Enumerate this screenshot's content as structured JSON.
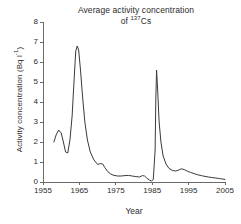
{
  "chart_data": {
    "type": "line",
    "title_line1": "Average activity concentration",
    "title_line2_prefix": "of ",
    "title_isotope_mass": "137",
    "title_isotope_symbol": "Cs",
    "xlabel": "Year",
    "ylabel_prefix": "Activity concentration (Bq l",
    "ylabel_exponent": "-1",
    "ylabel_suffix": ")",
    "xlim": [
      1955,
      2005
    ],
    "ylim": [
      0,
      8
    ],
    "xticks": [
      1955,
      1965,
      1975,
      1985,
      1995,
      2005
    ],
    "yticks": [
      0,
      1,
      2,
      3,
      4,
      5,
      6,
      7,
      8
    ],
    "grid": false,
    "legend": "none",
    "line_color": "#3a3a3a",
    "axis_color": "#6b6b6b",
    "series": [
      {
        "name": "137Cs activity concentration",
        "x": [
          1958.0,
          1958.6,
          1959.3,
          1960.0,
          1960.6,
          1961.2,
          1961.8,
          1962.4,
          1963.0,
          1963.6,
          1964.0,
          1964.4,
          1964.8,
          1965.3,
          1965.9,
          1966.5,
          1967.2,
          1968.0,
          1969.0,
          1970.0,
          1970.8,
          1971.4,
          1972.0,
          1972.8,
          1973.6,
          1974.5,
          1975.5,
          1976.5,
          1977.5,
          1978.5,
          1979.5,
          1980.5,
          1981.5,
          1982.3,
          1982.9,
          1983.5,
          1984.2,
          1984.8,
          1985.3,
          1985.8,
          1986.0,
          1986.2,
          1986.5,
          1986.9,
          1987.4,
          1988.0,
          1988.8,
          1989.6,
          1990.5,
          1991.5,
          1992.3,
          1993.0,
          1993.8,
          1994.6,
          1995.5,
          1996.5,
          1997.5,
          1998.5,
          1999.5,
          2000.5,
          2001.5,
          2002.5,
          2003.5,
          2004.3,
          2005.0
        ],
        "y": [
          2.0,
          2.35,
          2.6,
          2.45,
          2.0,
          1.5,
          1.45,
          2.1,
          3.3,
          5.3,
          6.55,
          6.8,
          6.6,
          5.6,
          4.2,
          3.0,
          2.1,
          1.5,
          1.1,
          0.88,
          0.92,
          0.9,
          0.72,
          0.52,
          0.4,
          0.33,
          0.3,
          0.3,
          0.32,
          0.33,
          0.3,
          0.27,
          0.25,
          0.32,
          0.3,
          0.2,
          0.1,
          0.05,
          0.12,
          1.6,
          4.2,
          5.6,
          4.6,
          3.0,
          2.0,
          1.3,
          0.9,
          0.68,
          0.58,
          0.55,
          0.6,
          0.66,
          0.62,
          0.55,
          0.48,
          0.42,
          0.36,
          0.32,
          0.28,
          0.25,
          0.22,
          0.2,
          0.17,
          0.15,
          0.13
        ]
      }
    ],
    "annotations": []
  }
}
